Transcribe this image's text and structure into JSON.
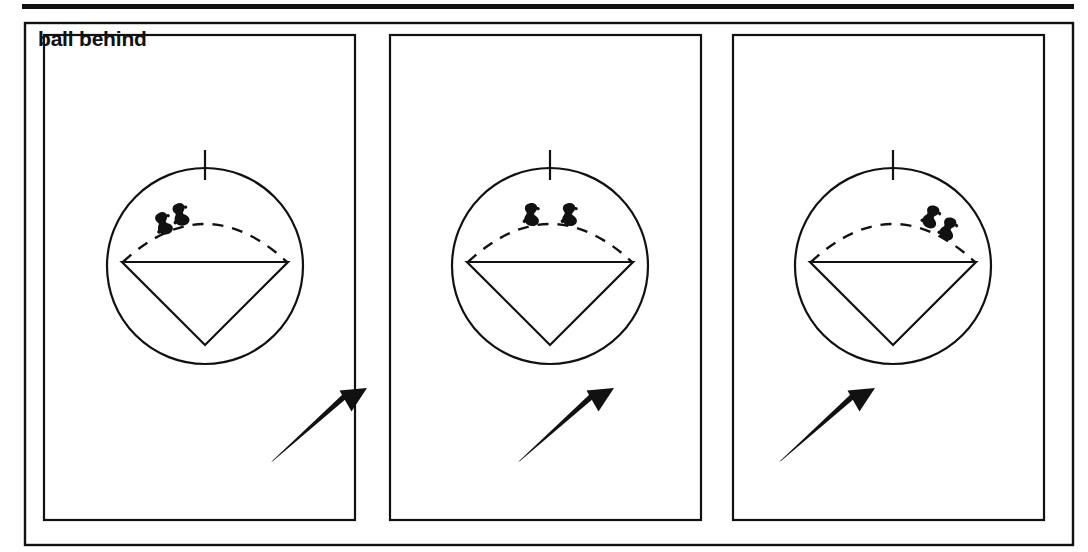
{
  "figure": {
    "kind": "line-art-diagram",
    "label": "ball behind",
    "panel_count": 3,
    "ink_color": "#111111",
    "background_color": "#ffffff",
    "top_rule": {
      "present": true,
      "thickness_px": 5
    },
    "outer_frame": {
      "present": true,
      "stroke_px": 2
    },
    "panels": [
      {
        "id": "panel-1",
        "marker_arrangement": "pair-clustered-left-of-arc-apex",
        "markers": [
          {
            "id": "marker-1",
            "cx": 163,
            "cy": 223,
            "rotation_deg": -18
          },
          {
            "id": "marker-2",
            "cx": 180,
            "cy": 214,
            "rotation_deg": -14
          }
        ],
        "arrow": {
          "tail_x": 271,
          "tail_y": 462,
          "head_x": 347,
          "head_y": 395
        },
        "tick_label": "top-tick",
        "dashed_arc": true,
        "chord": true,
        "triangle": "inverted"
      },
      {
        "id": "panel-2",
        "marker_arrangement": "pair-split-symmetric-about-apex",
        "markers": [
          {
            "id": "marker-1",
            "cx": 531,
            "cy": 214,
            "rotation_deg": 0
          },
          {
            "id": "marker-2",
            "cx": 569,
            "cy": 214,
            "rotation_deg": 0
          }
        ],
        "arrow": {
          "tail_x": 518,
          "tail_y": 462,
          "head_x": 594,
          "head_y": 395
        },
        "tick_label": "top-tick",
        "dashed_arc": true,
        "chord": true,
        "triangle": "inverted"
      },
      {
        "id": "panel-3",
        "marker_arrangement": "pair-clustered-right-of-arc-apex",
        "markers": [
          {
            "id": "marker-1",
            "cx": 931,
            "cy": 216,
            "rotation_deg": 22
          },
          {
            "id": "marker-2",
            "cx": 948,
            "cy": 228,
            "rotation_deg": 22
          }
        ],
        "arrow": {
          "tail_x": 779,
          "tail_y": 462,
          "head_x": 855,
          "head_y": 395
        },
        "tick_label": "top-tick",
        "dashed_arc": true,
        "chord": true,
        "triangle": "inverted"
      }
    ]
  }
}
